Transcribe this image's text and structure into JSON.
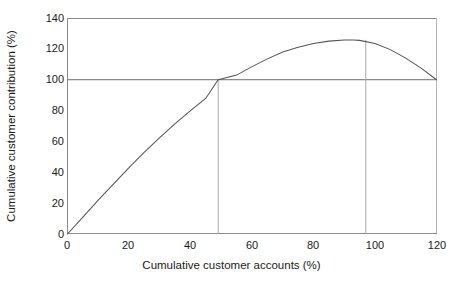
{
  "chart_data": {
    "type": "line",
    "title": "",
    "xlabel": "Cumulative customer accounts (%)",
    "ylabel": "Cumulative customer contribution (%)",
    "xlim": [
      0,
      120
    ],
    "ylim": [
      0,
      140
    ],
    "xticks": [
      0,
      20,
      40,
      60,
      80,
      100,
      120
    ],
    "yticks": [
      0,
      20,
      40,
      60,
      80,
      100,
      120,
      140
    ],
    "xtick_labels": [
      "0",
      "20",
      "40",
      "60",
      "80",
      "100",
      "120"
    ],
    "ytick_labels": [
      "0",
      "20",
      "40",
      "60",
      "80",
      "100",
      "120",
      "140"
    ],
    "grid": false,
    "legend": "none",
    "series": [
      {
        "name": "Cumulative customer contribution",
        "x": [
          0,
          5,
          10,
          15,
          20,
          25,
          30,
          35,
          40,
          45,
          49,
          55,
          60,
          65,
          70,
          75,
          80,
          85,
          90,
          93,
          95,
          100,
          105,
          110,
          115,
          120
        ],
        "y": [
          0,
          11,
          22,
          32.5,
          43,
          53,
          62.5,
          71.5,
          80,
          88,
          100,
          103,
          108.5,
          113.5,
          118,
          121,
          123.5,
          125,
          125.7,
          125.8,
          125.5,
          123.5,
          119.5,
          114,
          107.5,
          100
        ]
      }
    ],
    "reference_lines": [
      {
        "name": "contribution-100-line",
        "type": "horizontal",
        "value": 100
      },
      {
        "name": "breakeven-accounts-line",
        "type": "vertical",
        "value": 49
      },
      {
        "name": "peak-accounts-line",
        "type": "vertical",
        "value": 97
      }
    ],
    "annotations": {
      "peak_value": 125.8,
      "peak_at_accounts": 93,
      "crosses_100_at_accounts": 49,
      "end_value": 100
    },
    "colors": {
      "axis": "#808080",
      "curve": "#4a4a4a",
      "reference_line": "#9a9a9a",
      "background": "#ffffff",
      "text": "#1a1a1a"
    }
  }
}
